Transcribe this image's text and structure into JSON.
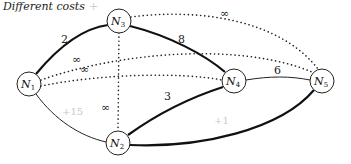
{
  "title": "Different costs",
  "title_mark": "+",
  "colors": {
    "edge": "#111111",
    "faint_label": "#c8c8c8",
    "node_fill": "#ffffff"
  },
  "nodes": [
    {
      "id": "N1",
      "label": "N",
      "sub": "1",
      "x": 29,
      "y": 84
    },
    {
      "id": "N2",
      "label": "N",
      "sub": "2",
      "x": 118,
      "y": 143
    },
    {
      "id": "N3",
      "label": "N",
      "sub": "3",
      "x": 119,
      "y": 21
    },
    {
      "id": "N4",
      "label": "N",
      "sub": "4",
      "x": 234,
      "y": 81
    },
    {
      "id": "N5",
      "label": "N",
      "sub": "5",
      "x": 322,
      "y": 81
    }
  ],
  "edges": [
    {
      "from": "N1",
      "to": "N3",
      "style": "thick",
      "cost": "2"
    },
    {
      "from": "N3",
      "to": "N4",
      "style": "thick",
      "cost": "8"
    },
    {
      "from": "N4",
      "to": "N5",
      "style": "thin",
      "cost": "6"
    },
    {
      "from": "N2",
      "to": "N4",
      "style": "thick",
      "cost": "3"
    },
    {
      "from": "N2",
      "to": "N5",
      "style": "thick",
      "cost": "+1"
    },
    {
      "from": "N1",
      "to": "N2",
      "style": "thin",
      "cost": "+15"
    },
    {
      "from": "N3",
      "to": "N5",
      "style": "dotted",
      "cost": "∞"
    },
    {
      "from": "N3",
      "to": "N2",
      "style": "dotted",
      "cost": "∞"
    },
    {
      "from": "N1",
      "to": "N5",
      "style": "dotted",
      "cost": "∞"
    },
    {
      "from": "N1",
      "to": "N4",
      "style": "dotted",
      "cost": "∞"
    }
  ],
  "labels": {
    "n1_n3": "2",
    "n3_n4": "8",
    "n4_n5": "6",
    "n2_n4": "3",
    "n2_n5": "+1",
    "n1_n2": "+15",
    "n3_n5": "∞",
    "n3_n2": "∞",
    "n1_n5": "∞",
    "n1_n4": "∞"
  }
}
